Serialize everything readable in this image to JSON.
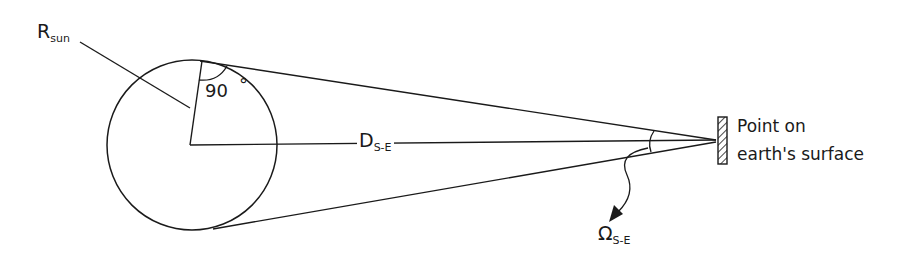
{
  "diagram": {
    "labels": {
      "radius": {
        "main": "R",
        "sub": "sun"
      },
      "angle": "90",
      "degree": "°",
      "distance": {
        "main": "D",
        "sub": "S-E"
      },
      "solid_angle": {
        "main": "Ω",
        "sub": "S-E"
      },
      "point_line1": "Point on",
      "point_line2": "earth's surface"
    },
    "colors": {
      "stroke": "#1a1a1a",
      "background": "#ffffff"
    }
  }
}
